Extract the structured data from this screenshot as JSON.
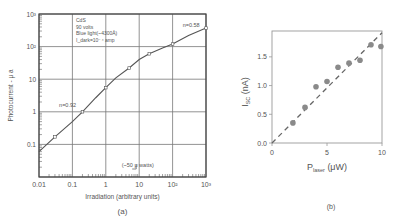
{
  "chart_data": [
    {
      "id": "a",
      "type": "line",
      "panel_label": "(a)",
      "xscale": "log",
      "yscale": "log",
      "xlabel": "Irradiation (arbitrary units)",
      "ylabel": "Photocurrent - μ a",
      "xlim": [
        0.01,
        1000
      ],
      "ylim": [
        0.01,
        1000
      ],
      "x_ticks": [
        "0.01",
        "0.1",
        "1",
        "10",
        "10²",
        "10³"
      ],
      "y_ticks": [
        "0.1",
        "1",
        "10",
        "10²",
        "10³"
      ],
      "grid": true,
      "legend_box": [
        "CdS",
        "90 volts",
        "Blue light(~4300Å)",
        "I_dark=10⁻⁴ amp"
      ],
      "annotations": [
        {
          "text": "n=0.92",
          "x": 0.04,
          "y": 1.4
        },
        {
          "text": "n=0.58",
          "x": 200,
          "y": 400
        },
        {
          "text": "(~50 μ watts)",
          "x": 3,
          "y": 0.02
        }
      ],
      "series": [
        {
          "name": "photocurrent",
          "x": [
            0.01,
            0.03,
            0.1,
            0.2,
            0.5,
            1,
            2,
            5,
            10,
            20,
            50,
            100,
            300,
            1000
          ],
          "y": [
            0.06,
            0.17,
            0.5,
            1.0,
            2.7,
            5.5,
            11,
            22,
            40,
            60,
            90,
            120,
            220,
            370
          ]
        }
      ]
    },
    {
      "id": "b",
      "type": "scatter",
      "panel_label": "(b)",
      "xlabel": "P_laser (μW)",
      "ylabel": "I_SC (nA)",
      "xlim": [
        0,
        10
      ],
      "ylim": [
        0,
        1.95
      ],
      "x_ticks": [
        "0",
        "5",
        "10"
      ],
      "y_ticks": [
        "0.0",
        "0.5",
        "1.0",
        "1.5"
      ],
      "grid": false,
      "series": [
        {
          "name": "measured",
          "x": [
            1.9,
            3.0,
            4.0,
            5.0,
            6.0,
            7.0,
            8.0,
            9.0,
            9.9
          ],
          "y": [
            0.35,
            0.62,
            0.98,
            1.07,
            1.32,
            1.39,
            1.44,
            1.71,
            1.68
          ]
        },
        {
          "name": "linear fit",
          "style": "dashed",
          "x": [
            0,
            10
          ],
          "y": [
            0,
            1.92
          ]
        }
      ]
    }
  ]
}
